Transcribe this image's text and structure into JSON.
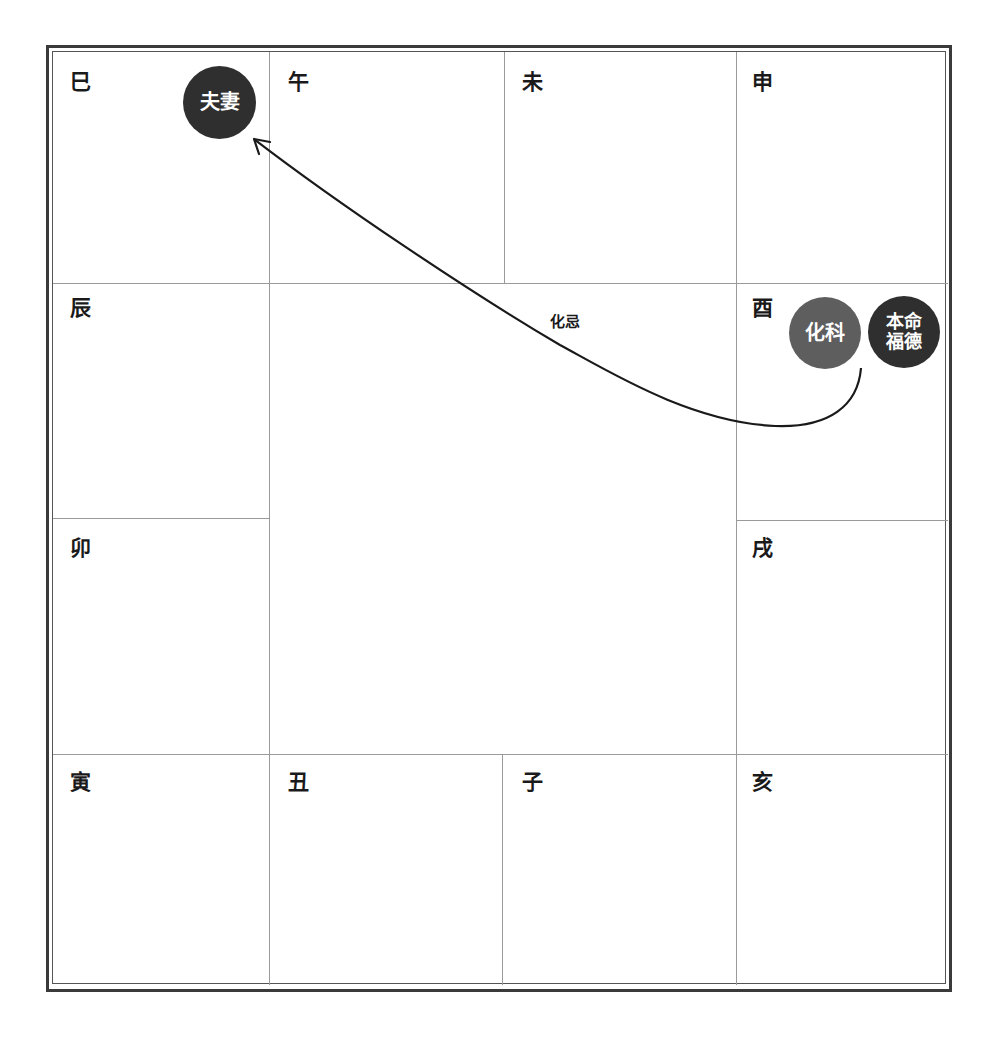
{
  "chart": {
    "branches": {
      "si": "巳",
      "wu": "午",
      "wei": "未",
      "shen": "申",
      "chen": "辰",
      "you": "酉",
      "mao": "卯",
      "xu": "戌",
      "yin": "寅",
      "chou": "丑",
      "zi": "子",
      "hai": "亥"
    },
    "badges": {
      "spouse": "夫妻",
      "transform_ke": "化科",
      "natal_fortune_line1": "本命",
      "natal_fortune_line2": "福德"
    },
    "arrow": {
      "label": "化忌",
      "from": "酉",
      "to": "巳"
    },
    "colors": {
      "badge_dark": "#2f2f2f",
      "badge_mid": "#5e5e5e",
      "frame": "#3a3a3a",
      "grid": "#9a9a9a"
    }
  }
}
